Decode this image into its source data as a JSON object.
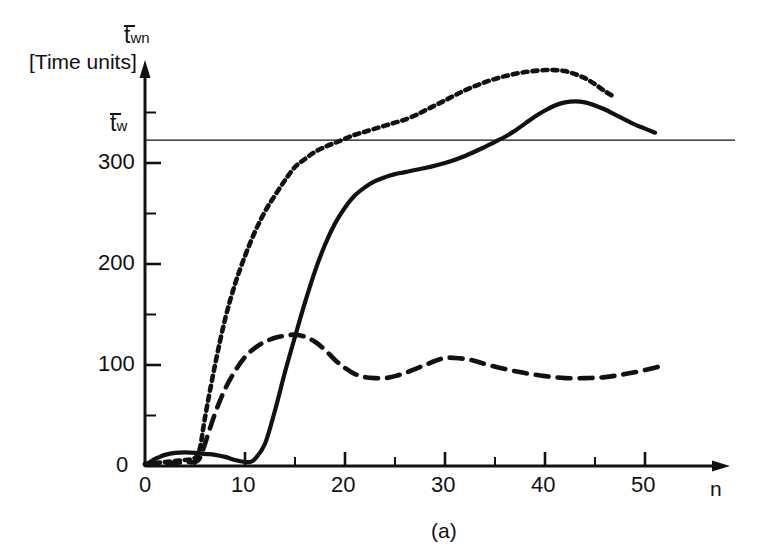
{
  "figure": {
    "caption": "(a)",
    "background": "#ffffff",
    "ink_color": "#111111"
  },
  "axes": {
    "y_axis": {
      "title_base": "t",
      "title_sub": "wn",
      "unit_label": "[Time units]",
      "tick_labels": [
        "0",
        "100",
        "200",
        "300"
      ],
      "tick_values": [
        0,
        100,
        200,
        300
      ],
      "minor_tick_values": [
        50,
        150,
        250,
        350
      ],
      "range": [
        0,
        400
      ]
    },
    "x_axis": {
      "name": "n",
      "tick_labels": [
        "0",
        "10",
        "20",
        "30",
        "40",
        "50"
      ],
      "tick_values": [
        0,
        10,
        20,
        30,
        40,
        50
      ],
      "minor_tick_values": [
        5,
        15,
        25,
        35,
        45
      ],
      "range": [
        0,
        56
      ]
    },
    "reference_line": {
      "label_base": "t",
      "label_sub": "w",
      "value": 322
    }
  },
  "chart_data": {
    "type": "line",
    "title": "",
    "xlabel": "n",
    "ylabel": "t̄wn [Time units]",
    "xlim": [
      0,
      56
    ],
    "ylim": [
      0,
      400
    ],
    "grid": false,
    "legend": null,
    "annotations": [
      {
        "text": "t̄w",
        "type": "horizontal-reference-line",
        "y": 322
      },
      {
        "text": "(a)",
        "type": "figure-caption"
      }
    ],
    "series": [
      {
        "name": "dotted-curve",
        "style": "dotted",
        "x": [
          0,
          1,
          2,
          3,
          4,
          5,
          5.5,
          6,
          7,
          8,
          9,
          10,
          11,
          12,
          13,
          14,
          15,
          16,
          17,
          18,
          19,
          20,
          21,
          22,
          23,
          24,
          25,
          26,
          27,
          28,
          30,
          32,
          34,
          36,
          38,
          40,
          41,
          42,
          43,
          44,
          45,
          46,
          46.8
        ],
        "y": [
          2,
          3,
          4,
          5,
          6,
          8,
          18,
          48,
          100,
          145,
          180,
          208,
          232,
          252,
          268,
          283,
          296,
          304,
          311,
          316,
          320,
          324,
          328,
          331,
          334,
          337,
          340,
          343,
          347,
          352,
          362,
          372,
          380,
          386,
          390,
          392,
          392,
          391,
          388,
          384,
          378,
          371,
          366
        ]
      },
      {
        "name": "dashed-curve",
        "style": "dashed",
        "x": [
          0,
          1,
          2,
          3,
          4,
          5,
          5.5,
          6,
          7,
          8,
          9,
          10,
          11,
          12,
          13,
          14,
          15,
          16,
          17,
          18,
          19,
          20,
          21,
          22,
          23,
          24,
          25,
          26,
          27,
          28,
          29,
          30,
          31,
          32,
          33,
          34,
          36,
          38,
          40,
          42,
          44,
          46,
          48,
          50,
          52
        ],
        "y": [
          2,
          2,
          3,
          3,
          4,
          4,
          8,
          22,
          52,
          76,
          94,
          108,
          117,
          123,
          127,
          129,
          130,
          128,
          123,
          115,
          105,
          97,
          91,
          88,
          87,
          87,
          89,
          92,
          96,
          100,
          104,
          107,
          107,
          106,
          104,
          101,
          96,
          92,
          89,
          87,
          87,
          88,
          91,
          95,
          100
        ]
      },
      {
        "name": "solid-curve",
        "style": "solid",
        "x": [
          0,
          0.5,
          1,
          1.5,
          2,
          3,
          4,
          5,
          6,
          7,
          8,
          9,
          10,
          10.5,
          11,
          12,
          13,
          14,
          15,
          16,
          17,
          18,
          19,
          20,
          21,
          22,
          23,
          24,
          25,
          26,
          28,
          30,
          32,
          34,
          35,
          36,
          37,
          38,
          39,
          40,
          41,
          42,
          43,
          44,
          45,
          46,
          47,
          48,
          49,
          50,
          51
        ],
        "y": [
          1,
          4,
          7,
          9,
          11,
          13,
          13.5,
          13,
          12,
          11,
          9,
          6,
          4,
          4,
          7,
          22,
          55,
          93,
          128,
          162,
          193,
          219,
          240,
          256,
          268,
          276,
          282,
          286,
          289,
          291,
          295,
          300,
          307,
          316,
          321,
          326,
          332,
          339,
          346,
          352,
          357,
          360,
          361,
          360,
          357,
          353,
          348,
          343,
          338,
          334,
          330
        ]
      }
    ]
  }
}
